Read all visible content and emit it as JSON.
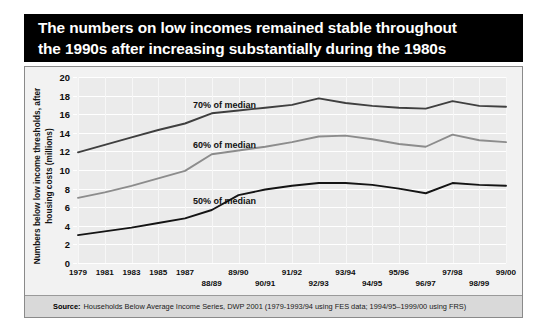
{
  "title": {
    "line1": "The numbers on low incomes remained stable throughout",
    "line2": "the 1990s after increasing substantially during the 1980s"
  },
  "source": {
    "label": "Source:",
    "text": "Households Below Average Income Series, DWP 2001 (1979-1993/94 using FES data; 1994/95–1999/00 using FRS)"
  },
  "colors": {
    "banner_background": "#000000",
    "banner_text": "#ffffff",
    "plate_background": "#f2f2f2",
    "plot_background": "#ebebeb",
    "gridline": "#ffffff",
    "source_strip": "#d9d9d9",
    "series_70": "#3f3f3f",
    "series_60": "#8c8c8c",
    "series_50": "#141414"
  },
  "chart_data": {
    "type": "line",
    "title": "The numbers on low incomes remained stable throughout the 1990s after increasing substantially during the 1980s",
    "xlabel": "",
    "ylabel": "Numbers below low income thresholds, after housing costs (millions)",
    "ylim": [
      0,
      20
    ],
    "ytick_step": 2,
    "yticks": [
      0,
      2,
      4,
      6,
      8,
      10,
      12,
      14,
      16,
      18,
      20
    ],
    "grid": true,
    "legend": "inline-labels",
    "x": [
      "1979",
      "1981",
      "1983",
      "1985",
      "1987",
      "88/89",
      "89/90",
      "90/91",
      "91/92",
      "92/93",
      "93/94",
      "94/95",
      "95/96",
      "96/97",
      "97/98",
      "98/99",
      "99/00"
    ],
    "x_rows": [
      "top",
      "top",
      "top",
      "top",
      "top",
      "bottom",
      "top",
      "bottom",
      "top",
      "bottom",
      "top",
      "bottom",
      "top",
      "bottom",
      "top",
      "bottom",
      "top"
    ],
    "series": [
      {
        "name": "70% of median",
        "color": "#3f3f3f",
        "values": [
          11.9,
          12.7,
          13.5,
          14.3,
          15.0,
          16.1,
          16.4,
          16.7,
          17.0,
          17.7,
          17.2,
          16.9,
          16.7,
          16.6,
          17.4,
          16.9,
          16.8
        ]
      },
      {
        "name": "60% of median",
        "color": "#8c8c8c",
        "values": [
          7.0,
          7.6,
          8.3,
          9.1,
          9.9,
          11.7,
          12.1,
          12.5,
          13.0,
          13.6,
          13.7,
          13.3,
          12.8,
          12.5,
          13.8,
          13.2,
          13.0
        ]
      },
      {
        "name": "50% of median",
        "color": "#141414",
        "values": [
          3.0,
          3.4,
          3.8,
          4.3,
          4.8,
          5.7,
          7.3,
          7.9,
          8.3,
          8.6,
          8.6,
          8.4,
          8.0,
          7.5,
          8.6,
          8.4,
          8.3
        ]
      }
    ],
    "annotations": [
      {
        "text": "70% of median",
        "x_index": 4.3,
        "y": 16.9
      },
      {
        "text": "60% of median",
        "x_index": 4.3,
        "y": 12.6
      },
      {
        "text": "50% of median",
        "x_index": 4.3,
        "y": 6.6
      }
    ]
  }
}
